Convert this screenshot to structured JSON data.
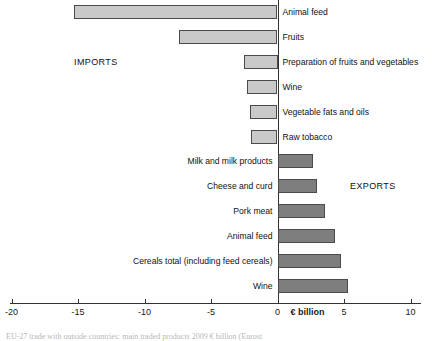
{
  "chart_data": {
    "type": "bar",
    "orientation": "horizontal",
    "title": "",
    "subtitle": "",
    "xlabel": "€ billion",
    "ylabel": "",
    "xlim": [
      -20,
      10
    ],
    "grid": false,
    "legend_position": "none",
    "axis_unit_label": "€ billion",
    "tick_labels": [
      "-20",
      "-15",
      "-10",
      "-5",
      "0",
      "5",
      "10"
    ],
    "tick_values": [
      -20,
      -15,
      -10,
      -5,
      0,
      5,
      10
    ],
    "annotations": [
      {
        "text": "IMPORTS",
        "side": "left"
      },
      {
        "text": "EXPORTS",
        "side": "right"
      }
    ],
    "categories": [
      "Animal feed",
      "Fruits",
      "Preparation of fruits and vegetables",
      "Wine",
      "Vegetable fats and oils",
      "Raw tobacco",
      "Milk and milk products",
      "Cheese and curd",
      "Pork meat",
      "Animal feed",
      "Cereals total (including feed cereals)",
      "Wine"
    ],
    "values": [
      -15.3,
      -7.4,
      -2.5,
      -2.3,
      -2.1,
      -2.0,
      2.7,
      3.0,
      3.6,
      4.3,
      4.8,
      5.3
    ],
    "series": [
      {
        "name": "Imports",
        "color": "#c9c9c9",
        "items": [
          {
            "label": "Animal feed",
            "value": -15.3
          },
          {
            "label": "Fruits",
            "value": -7.4
          },
          {
            "label": "Preparation of fruits and vegetables",
            "value": -2.5
          },
          {
            "label": "Wine",
            "value": -2.3
          },
          {
            "label": "Vegetable fats and oils",
            "value": -2.1
          },
          {
            "label": "Raw tobacco",
            "value": -2.0
          }
        ]
      },
      {
        "name": "Exports",
        "color": "#7e7e7e",
        "items": [
          {
            "label": "Milk and milk products",
            "value": 2.7
          },
          {
            "label": "Cheese and curd",
            "value": 3.0
          },
          {
            "label": "Pork meat",
            "value": 3.6
          },
          {
            "label": "Animal feed",
            "value": 4.3
          },
          {
            "label": "Cereals total (including feed cereals)",
            "value": 4.8
          },
          {
            "label": "Wine",
            "value": 5.3
          }
        ]
      }
    ]
  },
  "caption": {
    "text": "EU-27 trade with outside countries: main traded products 2009 € billion (Eurost"
  }
}
